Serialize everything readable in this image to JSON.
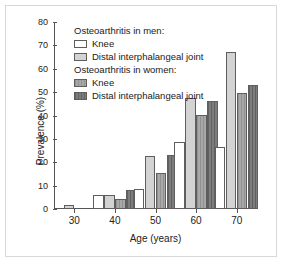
{
  "chart_data": {
    "type": "bar",
    "title": "",
    "xlabel": "Age (years)",
    "ylabel": "Prevalence (%)",
    "categories": [
      "30",
      "40",
      "50",
      "60",
      "70"
    ],
    "ylim": [
      0,
      80
    ],
    "yticks": [
      0,
      10,
      20,
      30,
      40,
      50,
      60,
      70,
      80
    ],
    "grid": false,
    "legend_position": "upper-left-inside",
    "series": [
      {
        "name": "Knee",
        "group": "Osteoarthritis in men:",
        "color": "#ffffff",
        "values": [
          null,
          5.8,
          8.6,
          28.6,
          26.7
        ]
      },
      {
        "name": "Distal interphalangeal joint",
        "group": "Osteoarthritis in men:",
        "color": "#d3d3d3",
        "values": [
          1.9,
          5.8,
          22.6,
          47.5,
          67.0
        ]
      },
      {
        "name": "Knee",
        "group": "Osteoarthritis in women:",
        "color": "#a8a8a8",
        "values": [
          null,
          4.4,
          15.4,
          40.4,
          49.6
        ]
      },
      {
        "name": "Distal interphalangeal joint",
        "group": "Osteoarthritis in women:",
        "color": "#7d7d7d",
        "values": [
          null,
          8.0,
          23.1,
          46.4,
          53.1
        ]
      }
    ]
  },
  "legend": {
    "blocks": [
      {
        "header": "Osteoarthritis in men:",
        "entries": [
          {
            "label": "Knee",
            "swatch": "#ffffff",
            "series_class": "s0"
          },
          {
            "label": "Distal interphalangeal joint",
            "swatch": "#d3d3d3",
            "series_class": "s1"
          }
        ]
      },
      {
        "header": "Osteoarthritis in women:",
        "entries": [
          {
            "label": "Knee",
            "swatch": "#a8a8a8",
            "series_class": "s2"
          },
          {
            "label": "Distal interphalangeal joint",
            "swatch": "#7d7d7d",
            "series_class": "s3"
          }
        ]
      }
    ]
  },
  "style": {
    "background": "#ffffff",
    "frame_color": "#d8d8d8",
    "axis_color": "#555555",
    "bar_edge": "#5e5e5e"
  }
}
